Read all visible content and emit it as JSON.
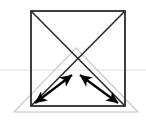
{
  "canvas": {
    "width": 146,
    "height": 129,
    "background": "#ffffff",
    "title": "Geometric figure: square with diagonals, inscribed gray triangle, horizontal reference line and two double-headed arrows"
  },
  "colors": {
    "stroke_dark": "#2b2b2b",
    "stroke_black": "#000000",
    "stroke_gray": "#c8c8c8",
    "stroke_light": "#e2e2e2",
    "background": "#ffffff"
  },
  "chart_data": {
    "type": "diagram",
    "title": "",
    "xlabel": "",
    "ylabel": "",
    "xlim": [
      0,
      146
    ],
    "ylim": [
      0,
      129
    ],
    "grid": false,
    "legend": "none",
    "shapes": [
      {
        "name": "square",
        "kind": "polygon",
        "color": "#2b2b2b",
        "stroke_width": 1.8,
        "fill": "none",
        "points": [
          [
            31,
            11
          ],
          [
            125,
            11
          ],
          [
            125,
            106
          ],
          [
            31,
            106
          ]
        ]
      },
      {
        "name": "diagonal-top-left-to-bottom-right",
        "kind": "line",
        "color": "#2b2b2b",
        "stroke_width": 1.6,
        "x1": 31,
        "y1": 11,
        "x2": 125,
        "y2": 106
      },
      {
        "name": "diagonal-top-right-to-bottom-left",
        "kind": "line",
        "color": "#2b2b2b",
        "stroke_width": 1.6,
        "x1": 125,
        "y1": 11,
        "x2": 31,
        "y2": 106
      },
      {
        "name": "gray-triangle",
        "kind": "polygon",
        "color": "#c8c8c8",
        "stroke_width": 1.1,
        "fill": "none",
        "points": [
          [
            76,
            48
          ],
          [
            138,
            112
          ],
          [
            14,
            112
          ]
        ]
      },
      {
        "name": "horizontal-reference-line",
        "kind": "line",
        "color": "#e2e2e2",
        "stroke_width": 1.0,
        "x1": 0,
        "y1": 70,
        "x2": 146,
        "y2": 70
      }
    ],
    "arrows": [
      {
        "name": "left-double-arrow",
        "direction": "double",
        "color": "#000000",
        "stroke_width": 2.2,
        "x1": 35,
        "y1": 103,
        "x2": 72,
        "y2": 75,
        "head_start": "down-left",
        "head_end": "up-right"
      },
      {
        "name": "right-double-arrow",
        "direction": "double",
        "color": "#000000",
        "stroke_width": 2.2,
        "x1": 80,
        "y1": 75,
        "x2": 118,
        "y2": 103,
        "head_start": "up-left",
        "head_end": "down-right"
      }
    ],
    "labels": []
  }
}
